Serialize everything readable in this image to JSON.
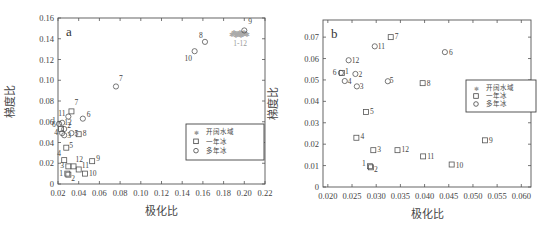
{
  "chart_data": [
    {
      "type": "scatter",
      "panel": "a",
      "xlabel": "极化比",
      "ylabel": "梯度比",
      "xlim": [
        0.02,
        0.22
      ],
      "ylim": [
        0,
        0.16
      ],
      "xticks": [
        "0.02",
        "0.04",
        "0.06",
        "0.08",
        "0.10",
        "0.12",
        "0.14",
        "0.16",
        "0.18",
        "0.20",
        "0.22"
      ],
      "yticks": [
        "0",
        "0.02",
        "0.04",
        "0.06",
        "0.08",
        "0.10",
        "0.12",
        "0.14",
        "0.16"
      ],
      "grid": false,
      "legend_position": "right-middle",
      "legend": [
        "开阔水域",
        "一年冰",
        "多年冰"
      ],
      "series": [
        {
          "name": "开阔水域",
          "marker": "star",
          "color": "#aaaaaa",
          "points": [
            {
              "x": 0.188,
              "y": 0.144
            },
            {
              "x": 0.19,
              "y": 0.146
            },
            {
              "x": 0.192,
              "y": 0.143
            },
            {
              "x": 0.193,
              "y": 0.145
            },
            {
              "x": 0.195,
              "y": 0.144
            },
            {
              "x": 0.196,
              "y": 0.146
            },
            {
              "x": 0.197,
              "y": 0.143
            },
            {
              "x": 0.198,
              "y": 0.145
            },
            {
              "x": 0.199,
              "y": 0.144
            },
            {
              "x": 0.2,
              "y": 0.146
            },
            {
              "x": 0.201,
              "y": 0.145
            },
            {
              "x": 0.203,
              "y": 0.144
            }
          ],
          "group_label": "1-12"
        },
        {
          "name": "一年冰",
          "marker": "square",
          "color": "#555555",
          "points": [
            {
              "label": "1",
              "x": 0.029,
              "y": 0.01
            },
            {
              "label": "2",
              "x": 0.03,
              "y": 0.009
            },
            {
              "label": "3",
              "x": 0.03,
              "y": 0.017
            },
            {
              "label": "4",
              "x": 0.026,
              "y": 0.023
            },
            {
              "label": "5",
              "x": 0.028,
              "y": 0.035
            },
            {
              "label": "6",
              "x": 0.023,
              "y": 0.053
            },
            {
              "label": "7",
              "x": 0.033,
              "y": 0.07
            },
            {
              "label": "8",
              "x": 0.04,
              "y": 0.048
            },
            {
              "label": "9",
              "x": 0.053,
              "y": 0.022
            },
            {
              "label": "10",
              "x": 0.046,
              "y": 0.01
            },
            {
              "label": "11",
              "x": 0.04,
              "y": 0.014
            },
            {
              "label": "12",
              "x": 0.035,
              "y": 0.017
            }
          ]
        },
        {
          "name": "多年冰",
          "marker": "circle",
          "color": "#555555",
          "points": [
            {
              "label": "1",
              "x": 0.021,
              "y": 0.058
            },
            {
              "label": "2",
              "x": 0.026,
              "y": 0.053
            },
            {
              "label": "3",
              "x": 0.026,
              "y": 0.047
            },
            {
              "label": "4",
              "x": 0.024,
              "y": 0.049
            },
            {
              "label": "5",
              "x": 0.033,
              "y": 0.049
            },
            {
              "label": "6",
              "x": 0.044,
              "y": 0.063
            },
            {
              "label": "7",
              "x": 0.076,
              "y": 0.094
            },
            {
              "label": "8",
              "x": 0.162,
              "y": 0.137
            },
            {
              "label": "9",
              "x": 0.2,
              "y": 0.148
            },
            {
              "label": "10",
              "x": 0.152,
              "y": 0.128
            },
            {
              "label": "11",
              "x": 0.03,
              "y": 0.065
            },
            {
              "label": "12",
              "x": 0.024,
              "y": 0.059
            }
          ]
        }
      ]
    },
    {
      "type": "scatter",
      "panel": "b",
      "xlabel": "极化比",
      "ylabel": "梯度比",
      "xlim": [
        0.019,
        0.062
      ],
      "ylim": [
        0,
        0.078
      ],
      "xticks": [
        "0.020",
        "0.025",
        "0.030",
        "0.035",
        "0.040",
        "0.045",
        "0.050",
        "0.055",
        "0.060"
      ],
      "yticks": [
        "0",
        "0.01",
        "0.02",
        "0.03",
        "0.04",
        "0.05",
        "0.06",
        "0.07"
      ],
      "grid": false,
      "legend_position": "right-upper",
      "legend": [
        "开阔水域",
        "一年冰",
        "多年冰"
      ],
      "series": [
        {
          "name": "一年冰",
          "marker": "square",
          "color": "#555555",
          "points": [
            {
              "label": "1",
              "x": 0.0287,
              "y": 0.0097
            },
            {
              "label": "2",
              "x": 0.0289,
              "y": 0.0092
            },
            {
              "label": "3",
              "x": 0.0294,
              "y": 0.0172
            },
            {
              "label": "4",
              "x": 0.0259,
              "y": 0.023
            },
            {
              "label": "5",
              "x": 0.0279,
              "y": 0.035
            },
            {
              "label": "6",
              "x": 0.0229,
              "y": 0.0533
            },
            {
              "label": "7",
              "x": 0.033,
              "y": 0.07
            },
            {
              "label": "8",
              "x": 0.0396,
              "y": 0.0485
            },
            {
              "label": "9",
              "x": 0.0525,
              "y": 0.0218
            },
            {
              "label": "10",
              "x": 0.0456,
              "y": 0.0105
            },
            {
              "label": "11",
              "x": 0.0397,
              "y": 0.0143
            },
            {
              "label": "12",
              "x": 0.0344,
              "y": 0.0172
            }
          ]
        },
        {
          "name": "多年冰",
          "marker": "circle",
          "color": "#555555",
          "points": [
            {
              "label": "1",
              "x": 0.0227,
              "y": 0.0533
            },
            {
              "label": "2",
              "x": 0.0257,
              "y": 0.0528
            },
            {
              "label": "3",
              "x": 0.026,
              "y": 0.047
            },
            {
              "label": "4",
              "x": 0.0235,
              "y": 0.0495
            },
            {
              "label": "5",
              "x": 0.0324,
              "y": 0.0494
            },
            {
              "label": "6",
              "x": 0.0442,
              "y": 0.063
            },
            {
              "label": "11",
              "x": 0.0297,
              "y": 0.0657
            },
            {
              "label": "12",
              "x": 0.0243,
              "y": 0.0592
            }
          ]
        }
      ]
    }
  ]
}
